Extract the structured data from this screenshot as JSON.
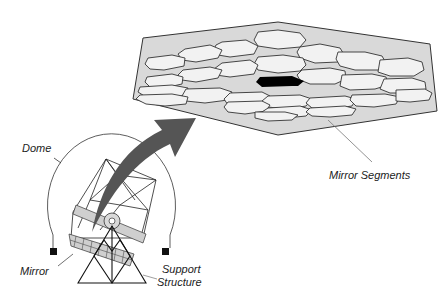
{
  "diagram": {
    "type": "telescope-segmented-mirror-illustration",
    "labels": {
      "dome": "Dome",
      "mirror": "Mirror",
      "support_line1": "Support",
      "support_line2": "Structure",
      "mirror_segments": "Mirror Segments"
    },
    "colors": {
      "background": "#ffffff",
      "mirror_plate": "#d9d9d9",
      "segment_fill": "#f2f2f2",
      "highlight_segment": "#000000",
      "arrow": "#555555",
      "line": "#333333",
      "band": "#cfcfcf"
    }
  }
}
